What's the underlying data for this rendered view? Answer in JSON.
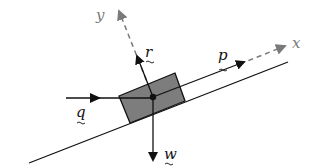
{
  "diagram": {
    "axes": {
      "x": {
        "label": "x",
        "color": "#7a7a7a",
        "style": "dashed"
      },
      "y": {
        "label": "y",
        "color": "#7a7a7a",
        "style": "dashed"
      }
    },
    "forces": [
      {
        "id": "r",
        "label": "r",
        "direction": "perpendicular to incline (normal)"
      },
      {
        "id": "p",
        "label": "p",
        "direction": "up the incline"
      },
      {
        "id": "q",
        "label": "q",
        "direction": "horizontal"
      },
      {
        "id": "w",
        "label": "w",
        "direction": "vertically down (weight)"
      }
    ],
    "block": {
      "fill": "#7d7d7d",
      "stroke": "#111111"
    },
    "incline": {
      "stroke": "#111111"
    }
  }
}
